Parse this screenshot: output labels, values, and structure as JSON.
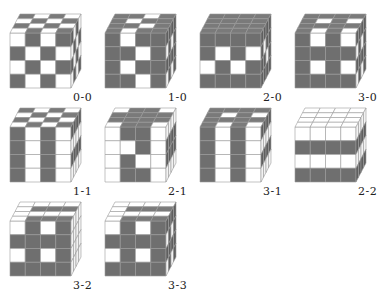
{
  "colors": {
    "dark": "#6f6f6f",
    "light": "#ffffff",
    "stroke": "#9a9a9a",
    "darkSide": "#5f5f5f",
    "lightSide": "#f2f2f2",
    "darkTop": "#7a7a7a"
  },
  "cubes": [
    {
      "label": "0-0",
      "x": 10,
      "y": 33,
      "front": [
        [
          0,
          1,
          0,
          1
        ],
        [
          1,
          0,
          1,
          0
        ],
        [
          0,
          1,
          0,
          1
        ],
        [
          1,
          0,
          1,
          0
        ]
      ],
      "top": [
        [
          1,
          0,
          1,
          0
        ],
        [
          0,
          1,
          0,
          1
        ],
        [
          1,
          0,
          1,
          0
        ],
        [
          0,
          1,
          0,
          1
        ]
      ],
      "side": [
        [
          1,
          0,
          1,
          0
        ],
        [
          0,
          1,
          0,
          1
        ],
        [
          1,
          0,
          1,
          0
        ],
        [
          0,
          1,
          0,
          1
        ]
      ]
    },
    {
      "label": "1-0",
      "x": 105,
      "y": 33,
      "front": [
        [
          1,
          0,
          1,
          1
        ],
        [
          1,
          1,
          0,
          1
        ],
        [
          1,
          0,
          1,
          1
        ],
        [
          1,
          1,
          0,
          1
        ]
      ],
      "top": [
        [
          1,
          1,
          0,
          1
        ],
        [
          1,
          0,
          1,
          1
        ],
        [
          1,
          1,
          0,
          1
        ],
        [
          1,
          0,
          1,
          1
        ]
      ],
      "side": [
        [
          1,
          1,
          1,
          1
        ],
        [
          0,
          1,
          0,
          1
        ],
        [
          1,
          1,
          1,
          1
        ],
        [
          0,
          1,
          0,
          1
        ]
      ]
    },
    {
      "label": "2-0",
      "x": 200,
      "y": 33,
      "front": [
        [
          1,
          1,
          1,
          1
        ],
        [
          1,
          0,
          1,
          0
        ],
        [
          0,
          1,
          0,
          1
        ],
        [
          1,
          1,
          1,
          1
        ]
      ],
      "top": [
        [
          1,
          1,
          1,
          1
        ],
        [
          1,
          1,
          1,
          1
        ],
        [
          1,
          1,
          1,
          1
        ],
        [
          1,
          1,
          1,
          1
        ]
      ],
      "side": [
        [
          1,
          1,
          1,
          1
        ],
        [
          1,
          0,
          1,
          1
        ],
        [
          1,
          1,
          0,
          1
        ],
        [
          1,
          1,
          1,
          1
        ]
      ]
    },
    {
      "label": "3-0",
      "x": 295,
      "y": 33,
      "front": [
        [
          1,
          0,
          1,
          0
        ],
        [
          1,
          1,
          1,
          1
        ],
        [
          1,
          0,
          1,
          0
        ],
        [
          1,
          1,
          1,
          1
        ]
      ],
      "top": [
        [
          1,
          1,
          1,
          1
        ],
        [
          1,
          0,
          1,
          0
        ],
        [
          1,
          1,
          1,
          1
        ],
        [
          1,
          0,
          1,
          0
        ]
      ],
      "side": [
        [
          1,
          1,
          1,
          1
        ],
        [
          0,
          1,
          0,
          1
        ],
        [
          1,
          1,
          1,
          1
        ],
        [
          0,
          1,
          0,
          1
        ]
      ]
    },
    {
      "label": "1-1",
      "x": 10,
      "y": 127,
      "front": [
        [
          1,
          0,
          1,
          0
        ],
        [
          1,
          0,
          1,
          0
        ],
        [
          1,
          0,
          1,
          0
        ],
        [
          1,
          0,
          1,
          0
        ]
      ],
      "top": [
        [
          1,
          0,
          1,
          0
        ],
        [
          0,
          1,
          0,
          1
        ],
        [
          1,
          0,
          1,
          0
        ],
        [
          0,
          1,
          0,
          1
        ]
      ],
      "side": [
        [
          1,
          1,
          1,
          1
        ],
        [
          0,
          0,
          0,
          0
        ],
        [
          1,
          1,
          1,
          1
        ],
        [
          0,
          0,
          0,
          0
        ]
      ]
    },
    {
      "label": "2-1",
      "x": 105,
      "y": 127,
      "front": [
        [
          0,
          1,
          1,
          0
        ],
        [
          0,
          0,
          1,
          0
        ],
        [
          0,
          1,
          0,
          0
        ],
        [
          0,
          1,
          1,
          0
        ]
      ],
      "top": [
        [
          0,
          1,
          1,
          0
        ],
        [
          1,
          1,
          1,
          1
        ],
        [
          1,
          1,
          1,
          1
        ],
        [
          0,
          1,
          1,
          0
        ]
      ],
      "side": [
        [
          0,
          0,
          0,
          0
        ],
        [
          1,
          1,
          1,
          1
        ],
        [
          1,
          1,
          1,
          1
        ],
        [
          0,
          0,
          0,
          0
        ]
      ]
    },
    {
      "label": "3-1",
      "x": 200,
      "y": 127,
      "front": [
        [
          1,
          0,
          1,
          0
        ],
        [
          1,
          0,
          1,
          0
        ],
        [
          1,
          0,
          1,
          0
        ],
        [
          1,
          0,
          1,
          0
        ]
      ],
      "top": [
        [
          1,
          1,
          1,
          1
        ],
        [
          1,
          0,
          1,
          0
        ],
        [
          1,
          1,
          1,
          1
        ],
        [
          1,
          0,
          1,
          0
        ]
      ],
      "side": [
        [
          1,
          1,
          1,
          1
        ],
        [
          0,
          0,
          0,
          0
        ],
        [
          1,
          1,
          1,
          1
        ],
        [
          0,
          0,
          0,
          0
        ]
      ]
    },
    {
      "label": "2-2",
      "x": 295,
      "y": 127,
      "front": [
        [
          0,
          0,
          0,
          0
        ],
        [
          1,
          1,
          1,
          1
        ],
        [
          0,
          0,
          0,
          0
        ],
        [
          1,
          1,
          1,
          1
        ]
      ],
      "top": [
        [
          0,
          0,
          0,
          0
        ],
        [
          0,
          0,
          0,
          0
        ],
        [
          0,
          0,
          0,
          0
        ],
        [
          0,
          0,
          0,
          0
        ]
      ],
      "side": [
        [
          0,
          0,
          0,
          0
        ],
        [
          1,
          1,
          1,
          1
        ],
        [
          0,
          0,
          0,
          0
        ],
        [
          1,
          1,
          1,
          1
        ]
      ]
    },
    {
      "label": "3-2",
      "x": 10,
      "y": 221,
      "front": [
        [
          0,
          1,
          0,
          1
        ],
        [
          1,
          1,
          1,
          1
        ],
        [
          0,
          1,
          0,
          1
        ],
        [
          1,
          1,
          1,
          1
        ]
      ],
      "top": [
        [
          0,
          0,
          0,
          0
        ],
        [
          0,
          1,
          1,
          1
        ],
        [
          0,
          0,
          0,
          0
        ],
        [
          0,
          1,
          1,
          1
        ]
      ],
      "side": [
        [
          0,
          0,
          0,
          0
        ],
        [
          0,
          0,
          0,
          0
        ],
        [
          0,
          0,
          0,
          0
        ],
        [
          0,
          0,
          0,
          0
        ]
      ]
    },
    {
      "label": "3-3",
      "x": 105,
      "y": 221,
      "front": [
        [
          0,
          1,
          0,
          1
        ],
        [
          1,
          1,
          1,
          1
        ],
        [
          0,
          1,
          0,
          1
        ],
        [
          1,
          1,
          1,
          1
        ]
      ],
      "top": [
        [
          0,
          0,
          0,
          0
        ],
        [
          0,
          1,
          1,
          1
        ],
        [
          0,
          0,
          0,
          0
        ],
        [
          0,
          1,
          1,
          1
        ]
      ],
      "side": [
        [
          1,
          1,
          1,
          1
        ],
        [
          0,
          1,
          0,
          1
        ],
        [
          1,
          1,
          1,
          1
        ],
        [
          0,
          1,
          0,
          1
        ]
      ]
    }
  ],
  "geometry": {
    "frontW": 61,
    "frontH": 55,
    "depthX": 10,
    "depthY": 19
  }
}
